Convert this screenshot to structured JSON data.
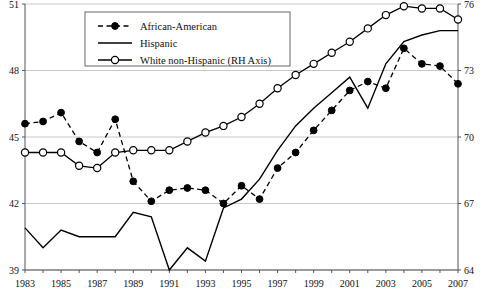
{
  "chart_data": {
    "type": "line",
    "title": "",
    "xlabel": "",
    "ylabel": "",
    "grid": true,
    "legend_position": "top-center",
    "x": [
      1983,
      1984,
      1985,
      1986,
      1987,
      1988,
      1989,
      1990,
      1991,
      1992,
      1993,
      1994,
      1995,
      1996,
      1997,
      1998,
      1999,
      2000,
      2001,
      2002,
      2003,
      2004,
      2005,
      2006,
      2007
    ],
    "left_axis": {
      "ylim": [
        39,
        51
      ],
      "ticks": [
        39,
        42,
        45,
        48,
        51
      ],
      "tick_labels": [
        "39",
        "42",
        "45",
        "48",
        "51"
      ]
    },
    "right_axis": {
      "ylim": [
        64,
        76
      ],
      "ticks": [
        64,
        67,
        70,
        73,
        76
      ],
      "tick_labels": [
        "64",
        "67",
        "70",
        "73",
        "76"
      ]
    },
    "x_tick_labels": [
      "1983",
      "1985",
      "1987",
      "1989",
      "1991",
      "1993",
      "1995",
      "1997",
      "1999",
      "2001",
      "2003",
      "2005",
      "2007"
    ],
    "series": [
      {
        "name": "African-American",
        "axis": "left",
        "marker": "filled-circle",
        "line": "dashed",
        "values": [
          45.6,
          45.7,
          46.1,
          44.8,
          44.3,
          45.8,
          43.0,
          42.1,
          42.6,
          42.7,
          42.6,
          42.0,
          42.8,
          42.2,
          43.6,
          44.3,
          45.3,
          46.2,
          47.1,
          47.5,
          47.2,
          49.0,
          48.3,
          48.2,
          47.4
        ]
      },
      {
        "name": "Hispanic",
        "axis": "left",
        "marker": "none",
        "line": "solid",
        "values": [
          40.9,
          40.0,
          40.8,
          40.5,
          40.5,
          40.5,
          41.6,
          41.4,
          39.0,
          40.0,
          39.4,
          41.8,
          42.2,
          43.1,
          44.4,
          45.5,
          46.3,
          47.0,
          47.7,
          46.3,
          48.3,
          49.3,
          49.6,
          49.8,
          49.8
        ]
      },
      {
        "name": "White non-Hispanic (RH Axis)",
        "axis": "right",
        "marker": "open-circle",
        "line": "solid",
        "values": [
          69.3,
          69.3,
          69.3,
          68.7,
          68.6,
          69.3,
          69.4,
          69.4,
          69.4,
          69.8,
          70.2,
          70.5,
          70.9,
          71.5,
          72.2,
          72.8,
          73.3,
          73.8,
          74.3,
          74.9,
          75.5,
          75.9,
          75.8,
          75.8,
          75.3
        ]
      }
    ]
  },
  "legend": {
    "items": [
      {
        "label": "African-American"
      },
      {
        "label": "Hispanic"
      },
      {
        "label": "White non-Hispanic (RH Axis)"
      }
    ]
  },
  "colors": {
    "line": "#000000",
    "grid": "#c8c8c8",
    "axis": "#555555",
    "background": "#ffffff"
  }
}
